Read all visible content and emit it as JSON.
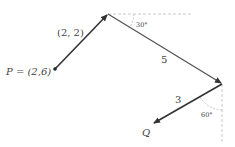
{
  "diagram": {
    "points": {
      "P": {
        "label": "P = (2,6)",
        "x": 55,
        "y": 69
      },
      "A": {
        "x": 108,
        "y": 14
      },
      "B": {
        "x": 222,
        "y": 84
      },
      "Q": {
        "label": "Q",
        "x": 153,
        "y": 124
      }
    },
    "vectors": [
      {
        "from": "P",
        "to": "A",
        "label": "(2, 2)"
      },
      {
        "from": "A",
        "to": "B",
        "label": "5"
      },
      {
        "from": "B",
        "to": "Q",
        "label": "3"
      }
    ],
    "angles": [
      {
        "at": "A",
        "label": "30°"
      },
      {
        "at": "B",
        "label": "60°"
      }
    ],
    "colors": {
      "vector": "#333333",
      "dashed": "#bbbbbb",
      "label": "#444444"
    }
  }
}
